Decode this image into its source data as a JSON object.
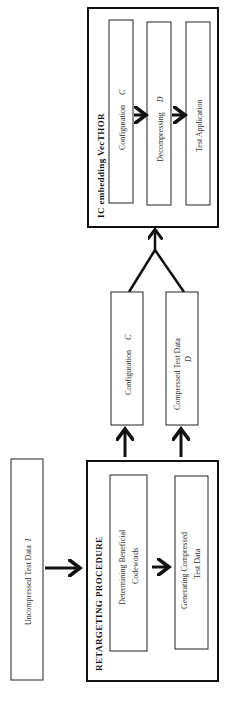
{
  "diagram": {
    "orientation": "rotated-90-ccw",
    "ic_block": {
      "title": "IC embedding VecTHOR",
      "stages": [
        {
          "label": "Configuration",
          "symbol": "C"
        },
        {
          "label": "Decompressing",
          "symbol": "D"
        },
        {
          "label": "Test Application",
          "symbol": ""
        }
      ]
    },
    "outputs": [
      {
        "label": "Configuration",
        "symbol": "C"
      },
      {
        "label": "Compressed Test Data",
        "symbol": "D"
      }
    ],
    "retargeting_block": {
      "title": "RETARGETING PROCEDURE",
      "stages": [
        {
          "line1": "Determining Beneficial",
          "line2": "Codewords"
        },
        {
          "line1": "Generating Compressed",
          "line2": "Test Data"
        }
      ]
    },
    "input": {
      "label": "Uncompressed Test Data",
      "symbol": "I"
    },
    "colors": {
      "stroke": "#111111",
      "background": "#ffffff",
      "text": "#333333"
    }
  }
}
